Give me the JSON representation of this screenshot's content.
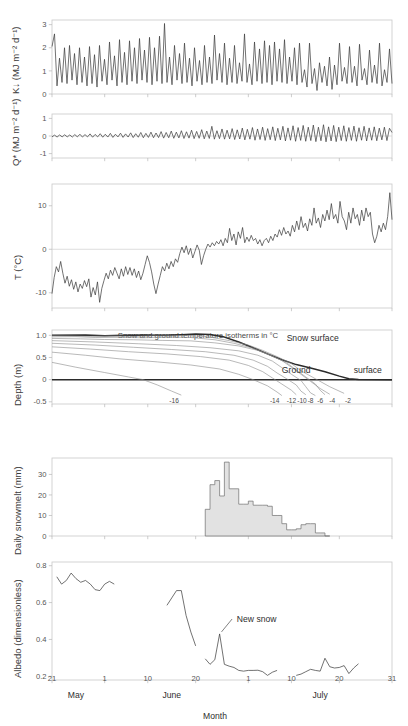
{
  "figure": {
    "xlabel": "Month",
    "x_ticks": [
      {
        "label": "21",
        "day": 141
      },
      {
        "label": "1",
        "day": 152
      },
      {
        "label": "10",
        "day": 161
      },
      {
        "label": "20",
        "day": 171
      },
      {
        "label": "1",
        "day": 182
      },
      {
        "label": "10",
        "day": 191
      },
      {
        "label": "20",
        "day": 201
      },
      {
        "label": "31",
        "day": 212
      }
    ],
    "month_labels": [
      {
        "label": "May",
        "day": 146
      },
      {
        "label": "June",
        "day": 166
      },
      {
        "label": "July",
        "day": 197
      }
    ],
    "x_range": [
      141,
      212
    ]
  },
  "chart_data": [
    {
      "type": "line",
      "panel": 1,
      "ylabel": "K↓  (MJ m⁻² d⁻¹)",
      "ylim": [
        0,
        3.2
      ],
      "y_ticks": [
        0,
        1,
        2,
        3
      ],
      "title": "",
      "xlabel": "",
      "grid": false,
      "description": "Daily incoming shortwave radiation, high-frequency day-to-day oscillation between ~0.1 and ~3.0",
      "values": [
        2.05,
        2.6,
        0.35,
        1.55,
        0.5,
        2.0,
        0.45,
        2.1,
        0.6,
        1.75,
        0.4,
        2.0,
        0.5,
        1.6,
        0.35,
        2.05,
        0.45,
        1.7,
        0.3,
        2.1,
        0.55,
        1.5,
        0.4,
        2.25,
        0.6,
        1.65,
        0.35,
        2.35,
        0.5,
        1.8,
        0.4,
        2.3,
        0.55,
        2.0,
        0.45,
        2.4,
        0.6,
        1.9,
        0.5,
        2.45,
        0.4,
        2.0,
        0.55,
        2.5,
        0.45,
        3.05,
        0.5,
        1.6,
        0.4,
        2.1,
        0.6,
        1.75,
        0.45,
        2.2,
        0.5,
        1.55,
        0.35,
        2.0,
        0.55,
        1.45,
        0.4,
        2.1,
        0.5,
        1.6,
        0.45,
        2.55,
        0.6,
        1.75,
        0.5,
        2.2,
        0.4,
        1.55,
        0.5,
        2.1,
        0.45,
        1.35,
        0.55,
        2.6,
        0.5,
        1.3,
        0.4,
        2.25,
        0.55,
        1.95,
        0.45,
        2.3,
        0.5,
        2.1,
        0.4,
        2.25,
        0.55,
        1.95,
        0.5,
        2.35,
        0.45,
        1.6,
        0.55,
        2.0,
        0.4,
        2.2,
        0.5,
        1.05,
        0.3,
        2.2,
        0.45,
        1.1,
        0.15,
        1.35,
        0.5,
        1.2,
        0.35,
        1.6,
        0.2,
        1.25,
        0.4,
        2.2,
        0.55,
        1.15,
        0.45,
        2.05,
        0.5,
        1.2,
        0.35,
        2.15,
        0.6,
        1.1,
        0.4,
        1.9,
        0.5,
        1.25,
        0.45,
        2.2,
        0.35,
        1.05,
        0.5,
        1.95,
        0.45
      ]
    },
    {
      "type": "line",
      "panel": 2,
      "ylabel": "Q* (MJ m⁻² d⁻¹)",
      "ylim": [
        -1.25,
        1.25
      ],
      "y_ticks": [
        -1,
        0,
        1
      ],
      "grid": false,
      "description": "Net radiation, near zero in May, amplitude increasing through June and July to about ±0.5",
      "values": [
        -0.05,
        0.05,
        -0.06,
        0.06,
        -0.05,
        0.07,
        -0.05,
        0.06,
        -0.06,
        0.08,
        -0.05,
        0.1,
        -0.06,
        0.08,
        -0.05,
        0.12,
        -0.07,
        0.09,
        -0.05,
        0.13,
        -0.07,
        0.1,
        -0.06,
        0.15,
        -0.08,
        0.1,
        -0.05,
        0.16,
        -0.08,
        0.12,
        -0.06,
        0.18,
        -0.09,
        0.13,
        -0.07,
        0.2,
        -0.1,
        0.15,
        -0.08,
        0.22,
        -0.1,
        0.17,
        -0.09,
        0.25,
        -0.12,
        0.2,
        -0.1,
        0.28,
        -0.13,
        0.22,
        -0.11,
        0.3,
        -0.14,
        0.24,
        -0.12,
        0.33,
        -0.15,
        0.26,
        -0.13,
        0.36,
        -0.16,
        0.28,
        -0.14,
        0.55,
        -0.18,
        0.3,
        -0.15,
        0.4,
        -0.18,
        0.33,
        -0.16,
        0.42,
        -0.2,
        0.35,
        -0.17,
        0.45,
        -0.22,
        0.38,
        -0.18,
        0.48,
        -0.24,
        0.4,
        -0.2,
        0.5,
        -0.25,
        0.42,
        -0.21,
        0.52,
        -0.26,
        0.44,
        -0.22,
        0.55,
        -0.28,
        0.46,
        -0.24,
        0.58,
        -0.3,
        0.48,
        -0.25,
        0.6,
        -0.3,
        0.5,
        -0.26,
        0.62,
        -0.32,
        0.5,
        -0.27,
        0.64,
        -0.33,
        0.52,
        -0.28,
        0.6,
        -0.32,
        0.5,
        -0.26,
        0.58,
        -0.3,
        0.48,
        -0.25,
        0.56,
        -0.3,
        0.47,
        -0.24,
        0.55,
        -0.28,
        0.46,
        -0.24,
        0.52,
        -0.27,
        0.45,
        -0.22,
        0.5,
        -0.26,
        0.44,
        0.2
      ]
    },
    {
      "type": "line",
      "panel": 3,
      "ylabel": "T (°C)",
      "ylim": [
        -13.5,
        15
      ],
      "y_ticks": [
        -10,
        0,
        10
      ],
      "grid": false,
      "description": "Daily mean air temperature rising from about -10 °C in late May to about +8 °C in late July",
      "values": [
        -10.2,
        -6.5,
        -4.0,
        -5.2,
        -2.8,
        -5.5,
        -7.8,
        -6.2,
        -8.5,
        -7.0,
        -9.2,
        -7.5,
        -9.8,
        -8.0,
        -9.0,
        -7.2,
        -8.6,
        -6.8,
        -11.0,
        -8.8,
        -10.5,
        -7.5,
        -12.2,
        -9.0,
        -7.2,
        -5.5,
        -6.8,
        -4.8,
        -6.0,
        -4.2,
        -5.5,
        -6.8,
        -4.5,
        -6.2,
        -4.0,
        -5.8,
        -4.2,
        -6.0,
        -4.5,
        -6.5,
        -5.0,
        -7.0,
        -5.5,
        -3.5,
        -1.5,
        -3.0,
        -5.2,
        -8.0,
        -10.2,
        -8.0,
        -6.0,
        -4.0,
        -5.0,
        -3.2,
        -4.5,
        -2.8,
        -4.0,
        -2.2,
        -3.0,
        -1.0,
        0.5,
        -0.8,
        0.8,
        -1.2,
        0.2,
        -2.0,
        -0.5,
        1.0,
        -0.2,
        -3.5,
        -1.5,
        0.0,
        1.2,
        0.5,
        1.5,
        0.8,
        1.8,
        1.2,
        2.2,
        0.8,
        2.5,
        1.5,
        4.8,
        2.0,
        3.5,
        1.0,
        4.0,
        2.5,
        5.0,
        1.5,
        2.8,
        1.8,
        3.2,
        2.0,
        2.5,
        1.2,
        2.2,
        0.8,
        2.0,
        2.5,
        1.5,
        3.0,
        2.0,
        3.5,
        2.8,
        4.5,
        3.2,
        5.0,
        3.5,
        4.2,
        3.0,
        5.5,
        4.0,
        6.5,
        4.5,
        7.5,
        5.0,
        6.0,
        4.2,
        7.0,
        5.5,
        9.5,
        6.0,
        7.2,
        5.0,
        8.0,
        6.5,
        9.0,
        6.8,
        10.5,
        7.0,
        8.0,
        6.0,
        11.0,
        7.5,
        6.5,
        4.5,
        8.5,
        6.0,
        9.5,
        7.0,
        8.0,
        5.5,
        9.0,
        6.5,
        9.5,
        7.5,
        8.5,
        3.5,
        1.5,
        3.0,
        5.5,
        4.0,
        6.0,
        4.5,
        7.5,
        13.0,
        6.8
      ]
    },
    {
      "type": "contour",
      "panel": 4,
      "ylabel": "Depth (m)",
      "header": "Snow and ground temperature isotherms in °C",
      "ylim": [
        -0.55,
        1.12
      ],
      "y_ticks": [
        -0.5,
        0,
        0.5,
        1.0
      ],
      "isotherm_labels": [
        "-16",
        "-14",
        "-12",
        "-10",
        "-8",
        "-6",
        "-4",
        "-2"
      ],
      "annotations": [
        "Snow surface",
        "Ground",
        "surface"
      ],
      "description": "Snow and ground temperature isotherms; snow surface declines from 1.0 m to the ground surface by mid-July"
    },
    {
      "type": "bar",
      "panel": 5,
      "ylabel": "Daily snowmelt (mm)",
      "ylim": [
        0,
        38
      ],
      "y_ticks": [
        0,
        10,
        20,
        30
      ],
      "grid": false,
      "description": "Daily snowmelt confined to a two-week melt event in late June, peaking above 35 mm",
      "start_day": 173,
      "values": [
        13,
        25,
        27,
        19.5,
        36,
        23,
        23,
        15.5,
        15.5,
        17,
        15,
        15,
        15,
        14.5,
        10,
        10,
        6,
        3,
        3,
        3.5,
        5.5,
        6,
        6,
        1.5,
        1.5,
        0
      ]
    },
    {
      "type": "line",
      "panel": 6,
      "ylabel": "Albedo (dimensionless)",
      "ylim": [
        0.18,
        0.82
      ],
      "y_ticks": [
        0.2,
        0.4,
        0.6,
        0.8
      ],
      "grid": false,
      "annotation": "New snow",
      "description": "Surface albedo: ~0.7 over snow in late May, dropping to ~0.25 bare ground by late June, with a new-snow spike of 0.43",
      "segments": [
        {
          "start_day": 142,
          "values": [
            0.74,
            0.7,
            0.72,
            0.76,
            0.73,
            0.71,
            0.72,
            0.7,
            0.67,
            0.665,
            0.7,
            0.715,
            0.7
          ]
        },
        {
          "start_day": 165,
          "values": [
            0.585,
            0.625,
            0.665,
            0.665,
            0.53,
            0.44,
            0.365
          ]
        },
        {
          "start_day": 173,
          "values": [
            0.295,
            0.265,
            0.29,
            0.43,
            0.265,
            0.255,
            0.248,
            0.232,
            0.228,
            0.232,
            0.232,
            0.233,
            0.225,
            0.205,
            0.222,
            0.232
          ]
        },
        {
          "start_day": 192,
          "values": [
            0.205,
            0.212,
            0.225,
            0.238,
            0.232,
            0.228,
            0.298,
            0.252,
            0.245,
            0.248,
            0.258,
            0.215,
            0.245,
            0.268
          ]
        }
      ]
    }
  ]
}
